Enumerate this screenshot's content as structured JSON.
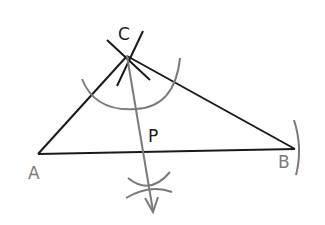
{
  "diagram": {
    "colors": {
      "background": "#ffffff",
      "triangle": "#1a1a1a",
      "construction": "#7a7a7a",
      "label_dark": "#1a1a1a",
      "label_gray": "#7a7a7a"
    },
    "points": {
      "A": {
        "label": "A",
        "x": 38,
        "y": 154
      },
      "B": {
        "label": "B",
        "x": 295,
        "y": 149
      },
      "C": {
        "label": "C",
        "x": 127,
        "y": 56
      },
      "P": {
        "label": "P",
        "x": 143,
        "y": 152
      }
    },
    "labels": {
      "A": "A",
      "B": "B",
      "C": "C",
      "P": "P"
    }
  }
}
